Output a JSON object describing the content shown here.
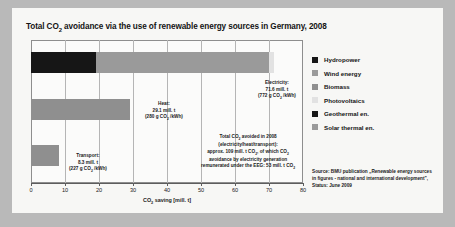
{
  "chart_data": {
    "type": "bar",
    "orientation": "horizontal",
    "xlabel": "CO₂ saving [mill. t]",
    "ylabel": "",
    "xlim": [
      0,
      80
    ],
    "xticks": [
      0,
      10,
      20,
      30,
      40,
      50,
      60,
      70,
      80
    ],
    "xtick_labels": [
      "0",
      "10",
      "20",
      "30",
      "40",
      "50",
      "60",
      "70",
      "80"
    ],
    "grid": true,
    "legend_position": "right",
    "categories": [
      "Electricity",
      "Heat",
      "Transport"
    ],
    "series": [
      {
        "name": "Hydropower",
        "color": "#161616",
        "values": [
          19.0,
          0,
          0
        ]
      },
      {
        "name": "Wind energy",
        "color": "#9a9a9a",
        "values": [
          31.6,
          0,
          0
        ]
      },
      {
        "name": "Biomass",
        "color": "#9a9a9a",
        "values": [
          19.4,
          29.1,
          8.3
        ]
      },
      {
        "name": "Photovoltaics",
        "color": "#e2e2e2",
        "values": [
          1.6,
          0,
          0
        ]
      },
      {
        "name": "Geothermal en.",
        "color": "#161616",
        "values": [
          0,
          0,
          0
        ]
      },
      {
        "name": "Solar thermal en.",
        "color": "#9a9a9a",
        "values": [
          0,
          0,
          0
        ]
      }
    ],
    "bars": [
      {
        "category": "Electricity",
        "total": 71.6,
        "segments": [
          {
            "name": "Hydropower",
            "start": 0,
            "end": 19.0,
            "color": "#161616"
          },
          {
            "name": "Wind energy",
            "start": 19.0,
            "end": 70.0,
            "color": "#9a9a9a"
          },
          {
            "name": "Photovoltaics",
            "start": 70.0,
            "end": 71.6,
            "color": "#e2e2e2"
          }
        ]
      },
      {
        "category": "Heat",
        "total": 29.1,
        "segments": [
          {
            "name": "Biomass",
            "start": 0,
            "end": 29.1,
            "color": "#8f8f8f"
          }
        ]
      },
      {
        "category": "Transport",
        "total": 8.3,
        "segments": [
          {
            "name": "Biomass",
            "start": 0,
            "end": 8.3,
            "color": "#8f8f8f"
          }
        ]
      }
    ],
    "annotations": [
      {
        "name": "electricity",
        "lines": [
          "Electricity:",
          "71.6 mill. t",
          "(772 g CO₂ /kWh)"
        ]
      },
      {
        "name": "heat",
        "lines": [
          "Heat:",
          "29.1 mill. t",
          "(280 g CO₂ /kWh)"
        ]
      },
      {
        "name": "transport",
        "lines": [
          "Transport:",
          "8.3 mill. t",
          "(227 g CO₂ /kWh)"
        ]
      },
      {
        "name": "total",
        "lines": [
          "Total CO₂ avoided in 2008",
          "(electricity/heat/transport):",
          "approx. 109 mill. t CO₂, of which CO₂",
          "avoidance by electricity generation",
          "remunerated under the EEG: 53 mill. t CO₂"
        ]
      }
    ]
  },
  "legend": {
    "items": [
      {
        "label": "Hydropower",
        "color": "#161616"
      },
      {
        "label": "Wind energy",
        "color": "#9a9a9a"
      },
      {
        "label": "Biomass",
        "color": "#8f8f8f"
      },
      {
        "label": "Photovoltaics",
        "color": "#e2e2e2"
      },
      {
        "label": "Geothermal en.",
        "color": "#161616"
      },
      {
        "label": "Solar thermal en.",
        "color": "#9a9a9a"
      }
    ]
  },
  "source": {
    "lines": [
      "Source: BMU publication „Renewable energy sources",
      "in figures - national and international development”,",
      "Status: June 2009"
    ]
  },
  "colors": {
    "figure_background": "#f7f7f5",
    "page_background": "#b9b9b9",
    "plot_background": "#fbfbfa",
    "gridline": "#b5b5b5",
    "axis": "#5d5d5d",
    "text": "#141414"
  }
}
